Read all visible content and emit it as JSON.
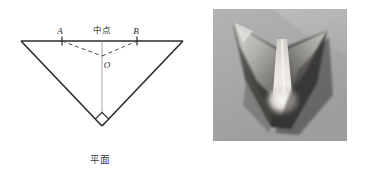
{
  "figure": {
    "background_color": "#ffffff",
    "panels": [
      {
        "id": "plane-diagram",
        "caption": "平面",
        "type": "line-diagram"
      },
      {
        "id": "formed-photo",
        "caption": "成型",
        "type": "photograph"
      }
    ]
  },
  "diagram": {
    "labels": {
      "point_a": "A",
      "point_b": "B",
      "midpoint": "中点",
      "point_o": "O"
    },
    "stroke_color": "#2b2b2b",
    "thin_stroke_color": "#8a8a8a",
    "dashed_stroke_color": "#4a4a4a",
    "geometry": {
      "top_left_vertex": [
        21,
        41
      ],
      "top_right_vertex": [
        183,
        41
      ],
      "apex_vertex": [
        102,
        126
      ],
      "tick_a": [
        62,
        41
      ],
      "tick_b": [
        137,
        41
      ],
      "point_o": [
        102,
        56
      ],
      "right_angle_marker": [
        102,
        119
      ],
      "right_angle_marker_size": 7
    },
    "label_positions": {
      "point_a": [
        60,
        33
      ],
      "midpoint": [
        102,
        32
      ],
      "point_b": [
        136,
        33
      ],
      "point_o": [
        106,
        66
      ]
    }
  },
  "photo": {
    "caption": "成型",
    "description": "grayscale photograph of a folded conical formed sheet with a bright vertical crease and pooled highlight at the lower centre",
    "frame": {
      "left": 213,
      "top": 9,
      "width": 134,
      "height": 132
    },
    "palette": {
      "background_gray": "#a9a9a9",
      "upper_light_gray": "#b9b9b9",
      "highlight_white": "#f2f0ec",
      "mid_gray": "#8c8c8c",
      "shadow_dark": "#4e4e4e",
      "shadow_darkest": "#333333",
      "crease_bright": "#ebe8e2"
    }
  }
}
